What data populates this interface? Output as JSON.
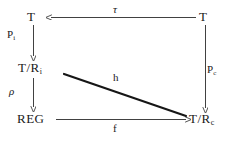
{
  "diagram": {
    "type": "commutative-diagram",
    "nodes": [
      {
        "id": "t-top-left",
        "base": "T",
        "sub": "",
        "position": "top-left"
      },
      {
        "id": "t-top-right",
        "base": "T",
        "sub": "",
        "position": "top-right"
      },
      {
        "id": "t-mod-ri",
        "base": "T/R",
        "sub": "i",
        "position": "middle-left"
      },
      {
        "id": "reg",
        "base": "REG",
        "sub": "",
        "position": "bottom-left"
      },
      {
        "id": "t-mod-rc",
        "base": "T/R",
        "sub": "c",
        "position": "bottom-right"
      }
    ],
    "edges": [
      {
        "id": "tau",
        "label": "τ",
        "sub": "",
        "style": "italic-greek",
        "from": "t-top-right",
        "to": "t-top-left",
        "direction": "leftward",
        "label_position": "above"
      },
      {
        "id": "pi",
        "label": "P",
        "sub": "i",
        "style": "roman",
        "from": "t-top-left",
        "to": "t-mod-ri",
        "direction": "downward",
        "label_position": "left"
      },
      {
        "id": "rho",
        "label": "ρ",
        "sub": "",
        "style": "italic-greek",
        "from": "t-mod-ri",
        "to": "reg",
        "direction": "downward",
        "label_position": "left"
      },
      {
        "id": "pc",
        "label": "P",
        "sub": "c",
        "style": "roman",
        "from": "t-top-right",
        "to": "t-mod-rc",
        "direction": "downward",
        "label_position": "right"
      },
      {
        "id": "h",
        "label": "h",
        "sub": "",
        "style": "roman",
        "from": "t-mod-ri",
        "to": "t-mod-rc",
        "direction": "diagonal",
        "label_position": "above"
      },
      {
        "id": "f",
        "label": "f",
        "sub": "",
        "style": "roman",
        "from": "reg",
        "to": "t-mod-rc",
        "direction": "rightward",
        "label_position": "below"
      }
    ],
    "colors": {
      "ink": "#1a1a1a",
      "background": "#ffffff",
      "line": "#2b2b2b"
    }
  }
}
